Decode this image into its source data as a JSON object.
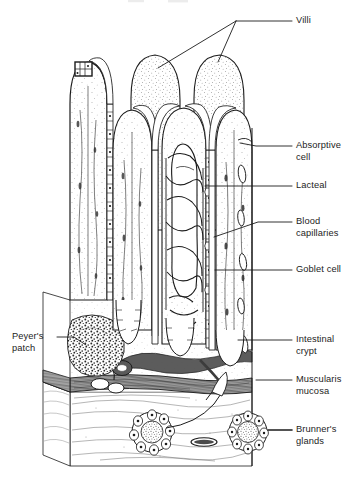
{
  "figure": {
    "background_color": "#ffffff",
    "ink_color": "#1b1b1b"
  },
  "labels": {
    "villi": "Villi",
    "absorptive_cell": "Absorptive\ncell",
    "lacteal": "Lacteal",
    "blood_capillaries": "Blood\ncapillaries",
    "goblet_cell": "Goblet cell",
    "intestinal_crypt": "Intestinal\ncrypt",
    "muscularis_mucosa": "Muscularis\nmucosa",
    "brunners_glands": "Brunner's\nglands",
    "peyers_patch": "Peyer's\npatch"
  },
  "structures": {
    "villus_1": "villus",
    "villus_2": "villus",
    "villus_3": "villus",
    "villus_4": "villus",
    "villus_5": "villus",
    "epithelium": "columnar-epithelium",
    "lacteal_vessel": "lacteal",
    "capillary_network": "blood-capillary-network",
    "crypt_1": "intestinal-crypt",
    "crypt_2": "intestinal-crypt",
    "muscularis_band": "muscularis-mucosa-band",
    "submucosa": "submucosa",
    "brunner_gland_1": "brunners-gland",
    "brunner_gland_2": "brunners-gland",
    "peyers_patch_mass": "peyers-patch",
    "detail_box": "epithelium-detail-box"
  }
}
